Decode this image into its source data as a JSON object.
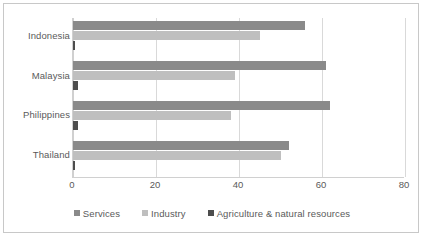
{
  "chart_data": {
    "type": "bar",
    "orientation": "horizontal",
    "title": "",
    "xlabel": "",
    "ylabel": "",
    "xlim": [
      0,
      80
    ],
    "xticks": [
      0,
      20,
      40,
      60,
      80
    ],
    "grid": true,
    "legend_position": "bottom",
    "categories": [
      "Indonesia",
      "Malaysia",
      "Philippines",
      "Thailand"
    ],
    "series": [
      {
        "name": "Services",
        "color": "#8a8a8a",
        "values": [
          56,
          61,
          62,
          52
        ]
      },
      {
        "name": "Industry",
        "color": "#bfbfbf",
        "values": [
          45,
          39,
          38,
          50
        ]
      },
      {
        "name": "Agriculture & natural resources",
        "color": "#4d4d4d",
        "values": [
          0.4,
          1.2,
          1.2,
          0.4
        ]
      }
    ]
  },
  "legend": {
    "items": [
      {
        "label": "Services",
        "color": "#8a8a8a"
      },
      {
        "label": "Industry",
        "color": "#bfbfbf"
      },
      {
        "label": "Agriculture & natural resources",
        "color": "#4d4d4d"
      }
    ]
  },
  "axis": {
    "tick_labels": [
      "0",
      "20",
      "40",
      "60",
      "80"
    ]
  },
  "colors": {
    "frame": "#c8c8c8",
    "gridline": "#d9d9d9",
    "text": "#5a5a5a",
    "background": "#ffffff"
  }
}
